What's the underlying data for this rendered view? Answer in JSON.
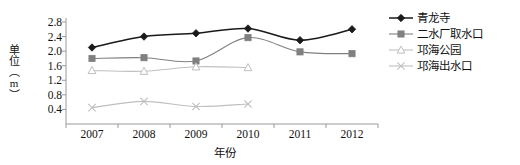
{
  "chart_data": {
    "type": "line",
    "title": "",
    "xlabel": "年份",
    "ylabel": "单位（m）",
    "categories": [
      "2007",
      "2008",
      "2009",
      "2010",
      "2011",
      "2012"
    ],
    "ylim": [
      0.0,
      2.8
    ],
    "yticks": [
      0.4,
      0.8,
      1.2,
      1.6,
      2.0,
      2.4,
      2.8
    ],
    "ytick_labels": [
      "0.4",
      "0.8",
      "1.2",
      "1.6",
      "2.0",
      "2.4",
      "2.8"
    ],
    "grid": false,
    "legend_position": "right",
    "series": [
      {
        "name": "青龙寺",
        "marker": "diamond",
        "color": "#1a1a1a",
        "x": [
          "2007",
          "2008",
          "2009",
          "2010",
          "2011",
          "2012"
        ],
        "values": [
          2.1,
          2.4,
          2.49,
          2.62,
          2.3,
          2.6
        ]
      },
      {
        "name": "二水厂取水口",
        "marker": "square",
        "color": "#808080",
        "x": [
          "2007",
          "2008",
          "2009",
          "2010",
          "2011",
          "2012"
        ],
        "values": [
          1.8,
          1.82,
          1.73,
          2.37,
          1.98,
          1.93
        ]
      },
      {
        "name": "邛海公园",
        "marker": "triangle",
        "color": "#bfbfbf",
        "x": [
          "2007",
          "2008",
          "2009",
          "2010"
        ],
        "values": [
          1.47,
          1.45,
          1.57,
          1.55
        ]
      },
      {
        "name": "邛海出水口",
        "marker": "cross",
        "color": "#bfbfbf",
        "x": [
          "2007",
          "2008",
          "2009",
          "2010"
        ],
        "values": [
          0.45,
          0.62,
          0.48,
          0.55
        ]
      }
    ]
  },
  "axis": {
    "line_color": "#9a9a9a",
    "text_color": "#111111"
  }
}
